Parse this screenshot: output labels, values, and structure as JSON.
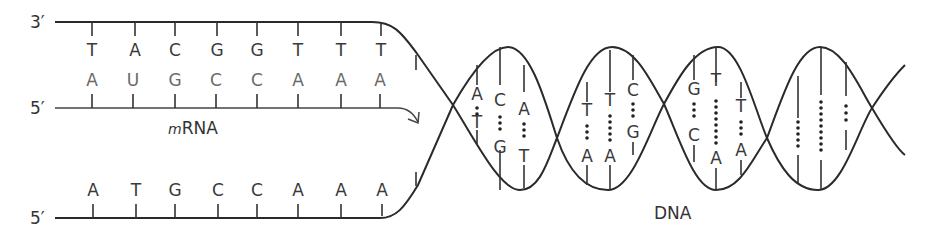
{
  "labels": {
    "top_end": "3′",
    "mrna_end": "5′",
    "bottom_end": "5′",
    "mrna_italic": "m",
    "mrna_rest": "RNA",
    "dna": "DNA"
  },
  "template_strand": {
    "bases": [
      "T",
      "A",
      "C",
      "G",
      "G",
      "T",
      "T",
      "T"
    ]
  },
  "mrna_strand": {
    "bases": [
      "A",
      "U",
      "G",
      "C",
      "C",
      "A",
      "A",
      "A"
    ]
  },
  "coding_strand": {
    "bases": [
      "A",
      "T",
      "G",
      "C",
      "C",
      "A",
      "A",
      "A"
    ]
  },
  "helix_pairs": [
    {
      "top": "A",
      "bottom": "T"
    },
    {
      "top": "C",
      "bottom": "G"
    },
    {
      "top": "A",
      "bottom": "T"
    },
    {
      "top": "T",
      "bottom": "A"
    },
    {
      "top": "T",
      "bottom": "A"
    },
    {
      "top": "C",
      "bottom": "G"
    },
    {
      "top": "G",
      "bottom": "C"
    },
    {
      "top": "T",
      "bottom": "A"
    },
    {
      "top": "T",
      "bottom": "A"
    }
  ],
  "colors": {
    "ink": "#2a2a2a",
    "rna": "#6a6a6a"
  }
}
